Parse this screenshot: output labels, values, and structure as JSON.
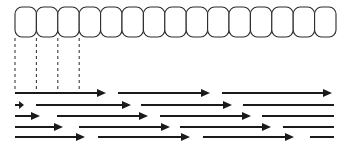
{
  "figure": {
    "name": "cell-row-with-staggered-arrows-diagram",
    "width": 349,
    "height": 144,
    "background_color": "#ffffff",
    "stroke_color": "#1a1a1a",
    "cell_stroke_color": "#2b2b2b",
    "dash_color": "#3a3a3a"
  },
  "cell_row": {
    "label": "cell-row",
    "count": 15,
    "x_start": 15,
    "y_top": 7,
    "cell_width": 21.4,
    "cell_height": 30,
    "corner_radius": 7,
    "stroke_width": 1.1
  },
  "guide_lines": {
    "label": "dashed-guide-lines",
    "count": 4,
    "y_top": 38,
    "y_bottom": 92,
    "stroke_width": 1.1,
    "dash_pattern": "3,3",
    "x_positions": [
      15,
      36.4,
      57.8,
      79.2
    ]
  },
  "arrow_rows": {
    "label": "staggered-arrow-rows",
    "stroke_width": 2.0,
    "head_length": 9,
    "head_half_width": 4,
    "rows": [
      {
        "label": "arrow-row-1",
        "y": 93,
        "arrows": [
          {
            "x1": 15,
            "x2": 106,
            "head": true
          },
          {
            "x1": 118,
            "x2": 210,
            "head": true
          },
          {
            "x1": 222,
            "x2": 332,
            "head": true
          }
        ]
      },
      {
        "label": "arrow-row-2",
        "y": 105,
        "arrows": [
          {
            "x1": 15,
            "x2": 24,
            "head": true
          },
          {
            "x1": 36,
            "x2": 131,
            "head": true
          },
          {
            "x1": 141,
            "x2": 232,
            "head": true
          },
          {
            "x1": 243,
            "x2": 334,
            "head": false
          }
        ]
      },
      {
        "label": "arrow-row-3",
        "y": 116,
        "arrows": [
          {
            "x1": 15,
            "x2": 40,
            "head": true
          },
          {
            "x1": 57,
            "x2": 148,
            "head": true
          },
          {
            "x1": 160,
            "x2": 251,
            "head": true
          },
          {
            "x1": 262,
            "x2": 334,
            "head": false
          }
        ]
      },
      {
        "label": "arrow-row-4",
        "y": 127,
        "arrows": [
          {
            "x1": 15,
            "x2": 63,
            "head": true
          },
          {
            "x1": 79,
            "x2": 170,
            "head": true
          },
          {
            "x1": 180,
            "x2": 271,
            "head": true
          },
          {
            "x1": 283,
            "x2": 334,
            "head": false
          }
        ]
      },
      {
        "label": "arrow-row-5",
        "y": 137,
        "arrows": [
          {
            "x1": 15,
            "x2": 85,
            "head": true
          },
          {
            "x1": 98,
            "x2": 190,
            "head": true
          },
          {
            "x1": 203,
            "x2": 294,
            "head": true
          },
          {
            "x1": 310,
            "x2": 334,
            "head": false
          }
        ]
      }
    ]
  }
}
